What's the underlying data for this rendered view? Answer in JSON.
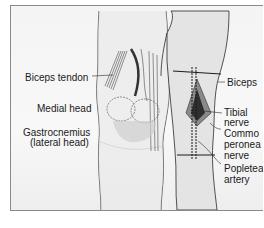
{
  "figure": {
    "left_view": {
      "labels": [
        {
          "id": "biceps-tendon",
          "text": "Biceps tendon"
        },
        {
          "id": "medial-head",
          "text": "Medial head"
        },
        {
          "id": "gastrocnemius-line1",
          "text": "Gastrocnemius"
        },
        {
          "id": "gastrocnemius-line2",
          "text": "(lateral head)"
        }
      ]
    },
    "right_view": {
      "labels": [
        {
          "id": "biceps",
          "text": "Biceps"
        },
        {
          "id": "tibial-line1",
          "text": "Tibial"
        },
        {
          "id": "tibial-line2",
          "text": "nerve"
        },
        {
          "id": "common-peroneal-line1",
          "text": "Commo"
        },
        {
          "id": "common-peroneal-line2",
          "text": "peronea"
        },
        {
          "id": "common-peroneal-line3",
          "text": "nerve"
        },
        {
          "id": "popliteal-line1",
          "text": "Popleteal"
        },
        {
          "id": "popliteal-line2",
          "text": "artery"
        }
      ]
    },
    "caption": "",
    "colors": {
      "line": "#2a2a2a",
      "skin": "#e6e6e6",
      "muscle_dark": "#3a3a3a",
      "background": "#f5f5f5"
    }
  }
}
